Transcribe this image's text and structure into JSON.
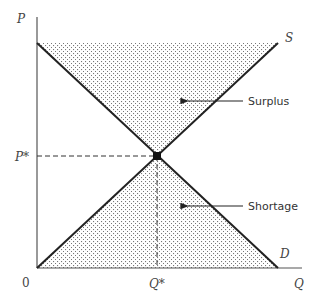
{
  "diagram": {
    "title": "",
    "type": "supply-demand",
    "axes": {
      "y_label": "P",
      "x_label": "Q",
      "origin_label": "0"
    },
    "curves": {
      "supply_label": "S",
      "demand_label": "D"
    },
    "equilibrium": {
      "price_label": "P*",
      "quantity_label": "Q*"
    },
    "regions": {
      "upper_label": "Surplus",
      "lower_label": "Shortage"
    },
    "colors": {
      "line": "#222222",
      "axis": "#555555",
      "dots": "#666666",
      "text": "#444444"
    }
  }
}
